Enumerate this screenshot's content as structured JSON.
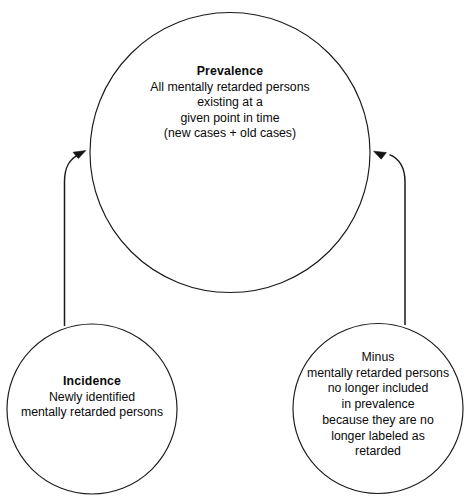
{
  "diagram": {
    "stroke_color": "#1a1a1a",
    "fill_color": "#ffffff",
    "text_color": "#0a0a0a",
    "nodes": [
      {
        "id": "prevalence",
        "shape": "circle",
        "heading": "Prevalence",
        "heading_bold": true,
        "lines": [
          "All mentally retarded persons",
          "existing at a",
          "given point in time",
          "(new cases  +  old cases)"
        ]
      },
      {
        "id": "incidence",
        "shape": "circle",
        "heading": "Incidence",
        "heading_bold": true,
        "lines": [
          "Newly identified",
          "mentally retarded persons"
        ]
      },
      {
        "id": "minus",
        "shape": "circle",
        "heading": "Minus",
        "heading_bold": false,
        "lines": [
          "mentally retarded persons",
          "no longer included",
          "in prevalence",
          "because they are no",
          "longer labeled as",
          "retarded"
        ]
      }
    ],
    "edges": [
      {
        "id": "incidence-to-prevalence",
        "from": "incidence",
        "to": "prevalence",
        "arrowhead": "up-right"
      },
      {
        "id": "minus-to-prevalence",
        "from": "minus",
        "to": "prevalence",
        "arrowhead": "up-left"
      }
    ]
  }
}
